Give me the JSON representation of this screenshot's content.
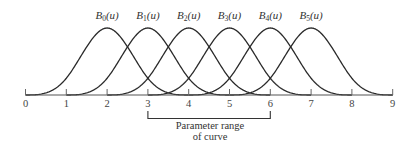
{
  "diagram": {
    "type": "uniform cubic B-spline basis functions",
    "axis": {
      "ticks": [
        "0",
        "1",
        "2",
        "3",
        "4",
        "5",
        "6",
        "7",
        "8",
        "9"
      ]
    },
    "basis_functions": [
      {
        "name": "B",
        "sub": "0",
        "arg": "(u)",
        "start": 0
      },
      {
        "name": "B",
        "sub": "1",
        "arg": "(u)",
        "start": 1
      },
      {
        "name": "B",
        "sub": "2",
        "arg": "(u)",
        "start": 2
      },
      {
        "name": "B",
        "sub": "3",
        "arg": "(u)",
        "start": 3
      },
      {
        "name": "B",
        "sub": "4",
        "arg": "(u)",
        "start": 4
      },
      {
        "name": "B",
        "sub": "5",
        "arg": "(u)",
        "start": 5
      }
    ],
    "parameter_range": {
      "from": 3,
      "to": 6,
      "caption_line1": "Parameter range",
      "caption_line2": "of curve"
    }
  }
}
